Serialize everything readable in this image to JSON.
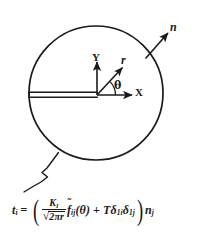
{
  "figure": {
    "type": "crack-tip-coordinate-diagram",
    "labels": {
      "normal_vector": "n",
      "radial": "r",
      "y_axis": "Y",
      "x_axis": "X",
      "angle": "θ"
    },
    "geometry": {
      "circle_center_x": 96,
      "circle_center_y": 93,
      "circle_radius": 67,
      "origin_x": 97,
      "origin_y": 95,
      "stroke_color": "#1a1a1a"
    },
    "equation": {
      "lhs_symbol": "t",
      "lhs_subscript": "i",
      "equals": "=",
      "open_paren": "(",
      "close_paren": ")",
      "numerator": "K",
      "numerator_subscript": "I",
      "denominator_radical": "√",
      "denominator_body": "2πr",
      "f_symbol": "f",
      "f_tilde": "̃",
      "f_subscript": "ij",
      "f_argument": "(θ)",
      "plus": "+",
      "T_symbol": "T",
      "delta1_symbol": "δ",
      "delta1_subscript": "1i",
      "delta2_symbol": "δ",
      "delta2_subscript": "1j",
      "n_symbol": "n",
      "n_subscript": "j",
      "plain_text": "t_i = ( K_I / sqrt(2*pi*r) * f~_ij(theta) + T*delta_1i*delta_1j ) n_j"
    }
  }
}
